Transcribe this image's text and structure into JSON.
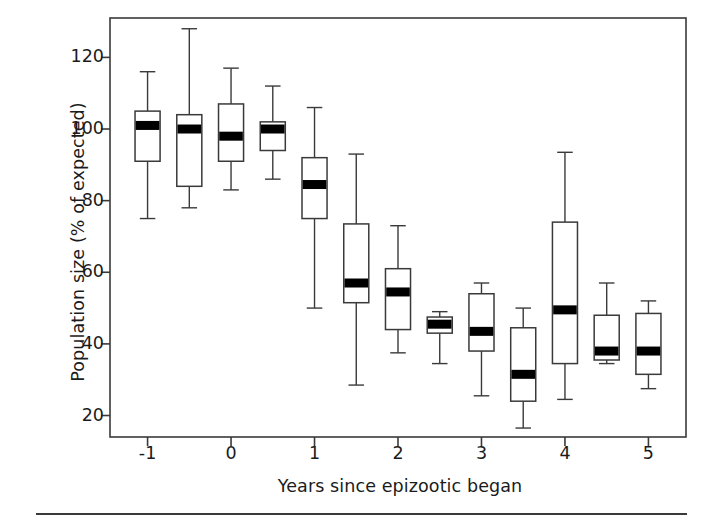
{
  "chart_data": {
    "type": "box",
    "title": "",
    "xlabel": "Years since epizootic began",
    "ylabel": "Population size (% of expected)",
    "xlim": [
      -1.45,
      5.45
    ],
    "ylim": [
      14,
      131
    ],
    "grid": false,
    "legend": "none",
    "xticks": [
      -1,
      0,
      1,
      2,
      3,
      4,
      5
    ],
    "xtick_labels": [
      "-1",
      "0",
      "1",
      "2",
      "3",
      "4",
      "5"
    ],
    "yticks": [
      20,
      40,
      60,
      80,
      100,
      120
    ],
    "ytick_labels": [
      "20",
      "40",
      "60",
      "80",
      "100",
      "120"
    ],
    "box_width": 0.3,
    "colors": {
      "box_fill": "#ffffff",
      "box_edge": "#3a3a3a",
      "median": "#000000",
      "whisker": "#3a3a3a",
      "axis": "#3a3a3a",
      "text": "#1b1b1b",
      "background": "#ffffff"
    },
    "boxes": [
      {
        "x": -1.0,
        "whisker_low": 75,
        "q1": 91,
        "median": 101,
        "q3": 105,
        "whisker_high": 116
      },
      {
        "x": -0.5,
        "whisker_low": 78,
        "q1": 84,
        "median": 100,
        "q3": 104,
        "whisker_high": 128
      },
      {
        "x": 0.0,
        "whisker_low": 83,
        "q1": 91,
        "median": 98,
        "q3": 107,
        "whisker_high": 117
      },
      {
        "x": 0.5,
        "whisker_low": 86,
        "q1": 94,
        "median": 100,
        "q3": 102,
        "whisker_high": 112
      },
      {
        "x": 1.0,
        "whisker_low": 50,
        "q1": 75,
        "median": 84.5,
        "q3": 92,
        "whisker_high": 106
      },
      {
        "x": 1.5,
        "whisker_low": 28.5,
        "q1": 51.5,
        "median": 57,
        "q3": 73.5,
        "whisker_high": 93
      },
      {
        "x": 2.0,
        "whisker_low": 37.5,
        "q1": 44,
        "median": 54.5,
        "q3": 61,
        "whisker_high": 73
      },
      {
        "x": 2.5,
        "whisker_low": 34.5,
        "q1": 43,
        "median": 45.5,
        "q3": 47.5,
        "whisker_high": 49
      },
      {
        "x": 3.0,
        "whisker_low": 25.5,
        "q1": 38,
        "median": 43.5,
        "q3": 54,
        "whisker_high": 57
      },
      {
        "x": 3.5,
        "whisker_low": 16.5,
        "q1": 24,
        "median": 31.5,
        "q3": 44.5,
        "whisker_high": 50
      },
      {
        "x": 4.0,
        "whisker_low": 24.5,
        "q1": 34.5,
        "median": 49.5,
        "q3": 74,
        "whisker_high": 93.5
      },
      {
        "x": 4.5,
        "whisker_low": 34.5,
        "q1": 35.5,
        "median": 38,
        "q3": 48,
        "whisker_high": 57
      },
      {
        "x": 5.0,
        "whisker_low": 27.5,
        "q1": 31.5,
        "median": 38,
        "q3": 48.5,
        "whisker_high": 52
      }
    ]
  }
}
